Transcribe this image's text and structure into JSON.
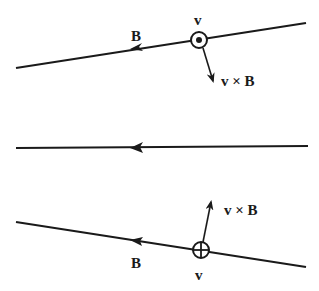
{
  "diagram": {
    "colors": {
      "ink": "#1a1a1a",
      "background": "#ffffff"
    },
    "top": {
      "field_label": "B",
      "velocity_label": "v",
      "velocity_symbol": "dot-out-of-page",
      "force_label": "v × B"
    },
    "middle": {
      "field_direction": "left"
    },
    "bottom": {
      "field_label": "B",
      "velocity_label": "v",
      "velocity_symbol": "cross-into-page",
      "force_label": "v × B"
    }
  }
}
